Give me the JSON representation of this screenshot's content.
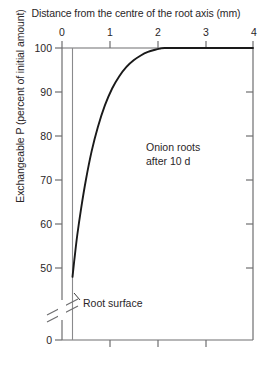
{
  "chart_data": {
    "type": "line",
    "title": "",
    "xlabel": "Distance from the centre of the root axis (mm)",
    "ylabel": "Exchangeable P (percent of initial amount)",
    "xlim": [
      0,
      4
    ],
    "ylim": [
      0,
      100
    ],
    "y_axis_break": true,
    "y_break_between": [
      0,
      45
    ],
    "xticks": [
      0,
      1,
      2,
      3,
      4
    ],
    "xtick_labels": [
      "0",
      "1",
      "2",
      "3",
      "4"
    ],
    "yticks": [
      0,
      50,
      60,
      70,
      80,
      90,
      100
    ],
    "ytick_labels": [
      "0",
      "50",
      "60",
      "70",
      "80",
      "90",
      "100"
    ],
    "grid": false,
    "legend": false,
    "series": [
      {
        "name": "Onion roots after 10 d",
        "x": [
          0.22,
          0.26,
          0.32,
          0.4,
          0.5,
          0.62,
          0.75,
          0.9,
          1.05,
          1.2,
          1.35,
          1.5,
          1.65,
          1.8,
          1.95,
          2.05,
          2.15,
          2.6,
          3.2,
          4.0
        ],
        "y": [
          48.0,
          52.0,
          57.5,
          63.5,
          70.0,
          76.5,
          82.0,
          87.0,
          90.8,
          93.6,
          95.7,
          97.2,
          98.3,
          99.1,
          99.6,
          99.85,
          100.0,
          100.0,
          100.0,
          100.0
        ]
      }
    ],
    "annotations": [
      {
        "name": "series-label",
        "text_line1": "Onion roots",
        "text_line2": "after 10 d",
        "x": 2.0,
        "y": 72
      },
      {
        "name": "root-surface-label",
        "text": "Root surface",
        "x": 0.45,
        "y": 44,
        "points_to_x": 0.22
      }
    ],
    "root_surface_x": 0.22
  },
  "axes": {
    "top_title": "Distance from the centre of the root axis (mm)",
    "y_title": "Exchangeable P (percent of initial amount)",
    "x_tick_labels": [
      "0",
      "1",
      "2",
      "3",
      "4"
    ],
    "y_tick_labels": [
      "100",
      "90",
      "80",
      "70",
      "60",
      "50",
      "0"
    ]
  },
  "annotations": {
    "series_label_line1": "Onion roots",
    "series_label_line2": "after 10 d",
    "root_surface": "Root surface"
  },
  "colors": {
    "axis": "#6e6e70",
    "curve": "#1a1a1a",
    "text": "#2a2628",
    "background": "#ffffff"
  }
}
